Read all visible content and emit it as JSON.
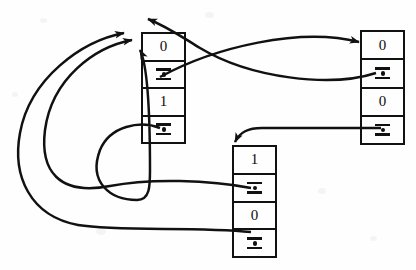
{
  "diagram": {
    "background_color": "#fefefe",
    "ink_color": "#111111",
    "pointer_glyph_name": "pointer-slot"
  },
  "nodes": [
    {
      "id": "node-left",
      "name": "cons-cell-left",
      "x": 141,
      "y": 32,
      "width": 45,
      "height": 112,
      "cells": [
        {
          "kind": "value",
          "text": "0",
          "name": "cell-value-0"
        },
        {
          "kind": "pointer",
          "text": "",
          "name": "cell-pointer-1"
        },
        {
          "kind": "value",
          "text": "1",
          "name": "cell-value-2"
        },
        {
          "kind": "pointer",
          "text": "",
          "name": "cell-pointer-3"
        }
      ]
    },
    {
      "id": "node-right",
      "name": "cons-cell-right",
      "x": 360,
      "y": 30,
      "width": 45,
      "height": 115,
      "cells": [
        {
          "kind": "value",
          "text": "0",
          "name": "cell-value-0"
        },
        {
          "kind": "pointer",
          "text": "",
          "name": "cell-pointer-1"
        },
        {
          "kind": "value",
          "text": "0",
          "name": "cell-value-2"
        },
        {
          "kind": "pointer",
          "text": "",
          "name": "cell-pointer-3"
        }
      ]
    },
    {
      "id": "node-bottom",
      "name": "cons-cell-bottom",
      "x": 232,
      "y": 145,
      "width": 45,
      "height": 113,
      "cells": [
        {
          "kind": "value",
          "text": "1",
          "name": "cell-value-0"
        },
        {
          "kind": "pointer",
          "text": "",
          "name": "cell-pointer-1"
        },
        {
          "kind": "value",
          "text": "0",
          "name": "cell-value-2"
        },
        {
          "kind": "pointer",
          "text": "",
          "name": "cell-pointer-3"
        }
      ]
    }
  ],
  "edges": [
    {
      "name": "edge-left-upper-pointer-to-right-node",
      "from": "node-left.cell-pointer-1",
      "to": "node-right",
      "arrow_at": "to"
    },
    {
      "name": "edge-right-upper-pointer-to-left-node-top",
      "from": "node-right.cell-pointer-1",
      "to": "node-left.top",
      "arrow_at": "to"
    },
    {
      "name": "edge-right-lower-pointer-to-bottom-node-top",
      "from": "node-right.cell-pointer-3",
      "to": "node-bottom.top",
      "arrow_at": "to"
    },
    {
      "name": "edge-left-lower-pointer-to-left-node",
      "from": "node-left.cell-pointer-3",
      "to": "node-left.left",
      "arrow_at": "to"
    },
    {
      "name": "edge-bottom-upper-pointer-to-left-node",
      "from": "node-bottom.cell-pointer-1",
      "to": "node-left.left",
      "arrow_at": "to"
    },
    {
      "name": "edge-bottom-lower-pointer-to-left-node",
      "from": "node-bottom.cell-pointer-3",
      "to": "node-left.left",
      "arrow_at": "to"
    }
  ]
}
